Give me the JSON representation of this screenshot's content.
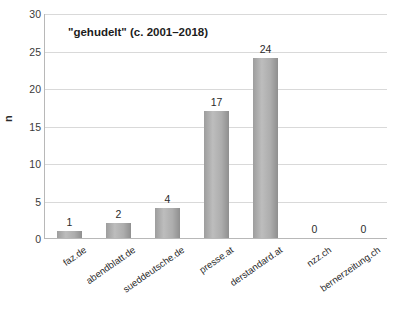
{
  "chart_data": {
    "type": "bar",
    "title": "\"gehudelt\" (c. 2001–2018)",
    "xlabel": "",
    "ylabel": "n",
    "categories": [
      "faz.de",
      "abendblatt.de",
      "sueddeutsche.de",
      "presse.at",
      "derstandard.at",
      "nzz.ch",
      "bernerzeitung.ch"
    ],
    "values": [
      1,
      2,
      4,
      17,
      24,
      0,
      0
    ],
    "data_labels": [
      "1",
      "2",
      "4",
      "17",
      "24",
      "0",
      "0"
    ],
    "ylim": [
      0,
      30
    ],
    "yticks": [
      0,
      5,
      10,
      15,
      20,
      25,
      30
    ],
    "ytick_labels": [
      "0",
      "5",
      "10",
      "15",
      "20",
      "25",
      "30"
    ],
    "grid": "horizontal",
    "legend": "none",
    "bar_color": "#a6a6a6",
    "grid_color": "#d9d9d9",
    "axis_color": "#b8b8b8",
    "background": "#ffffff"
  }
}
